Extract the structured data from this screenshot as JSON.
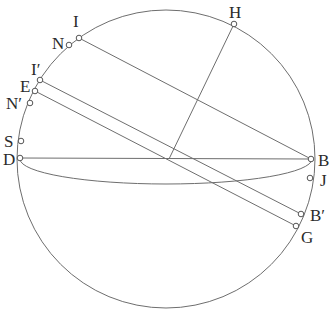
{
  "diagram": {
    "circle": {
      "cx": 166,
      "cy": 159,
      "r": 149
    },
    "ellipse": {
      "cx": 166,
      "cy": 159,
      "rx": 146,
      "ry": 25
    },
    "colors": {
      "line": "#6e6e6e",
      "text": "#2a2a2a",
      "point_fill": "#ffffff"
    },
    "points": [
      {
        "id": "I",
        "label": "I",
        "x": 79,
        "y": 38,
        "lx": 73,
        "ly": 27
      },
      {
        "id": "N",
        "label": "N",
        "x": 69,
        "y": 45,
        "lx": 52,
        "ly": 49
      },
      {
        "id": "H",
        "label": "H",
        "x": 234,
        "y": 24,
        "lx": 229,
        "ly": 18
      },
      {
        "id": "I2",
        "label": "I′",
        "x": 40,
        "y": 80,
        "lx": 31,
        "ly": 75
      },
      {
        "id": "E",
        "label": "E",
        "x": 35,
        "y": 91,
        "lx": 20,
        "ly": 92
      },
      {
        "id": "N2",
        "label": "N′",
        "x": 30,
        "y": 103,
        "lx": 6,
        "ly": 109
      },
      {
        "id": "S",
        "label": "S",
        "x": 21,
        "y": 141,
        "lx": 4,
        "ly": 147
      },
      {
        "id": "D",
        "label": "D",
        "x": 20,
        "y": 158,
        "lx": 3,
        "ly": 165
      },
      {
        "id": "B",
        "label": "B",
        "x": 311,
        "y": 159,
        "lx": 318,
        "ly": 166
      },
      {
        "id": "J",
        "label": "J",
        "x": 310,
        "y": 178,
        "lx": 320,
        "ly": 186
      },
      {
        "id": "B2",
        "label": "B′",
        "x": 301,
        "y": 214,
        "lx": 310,
        "ly": 221
      },
      {
        "id": "G",
        "label": "G",
        "x": 296,
        "y": 226,
        "lx": 301,
        "ly": 243
      }
    ],
    "segments": [
      {
        "from": "I",
        "to": "B"
      },
      {
        "from": "D",
        "to": "B"
      },
      {
        "from": "H",
        "to": "O",
        "x2": 169,
        "y2": 159
      },
      {
        "from": "I2",
        "to": "B2"
      },
      {
        "from": "E",
        "to": "G"
      }
    ]
  }
}
